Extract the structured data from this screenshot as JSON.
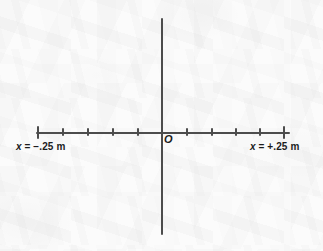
{
  "figure": {
    "name": "one-dimensional-position-axis",
    "background_color": "#fbfbfb",
    "ink_color": "#4c4c4c",
    "text_color": "#1c1c1c",
    "origin_label": "O",
    "left_label": {
      "variable": "x",
      "relation": "=",
      "value": "−.25 m",
      "full_text": "x = −.25 m"
    },
    "right_label": {
      "variable": "x",
      "relation": "=",
      "value": "+.25 m",
      "full_text": "x = +.25 m"
    }
  },
  "chart_data": {
    "type": "line",
    "title": "",
    "subtitle": "",
    "xlabel": "x",
    "ylabel": "",
    "grid": false,
    "legend": null,
    "annotations": [
      {
        "text": "O",
        "role": "origin-marker",
        "x": 0
      },
      {
        "text": "x = −.25 m",
        "role": "axis-end-label",
        "x": -0.25
      },
      {
        "text": "x = +.25 m",
        "role": "axis-end-label",
        "x": 0.25
      }
    ],
    "axes": [
      {
        "orientation": "horizontal",
        "unit": "m",
        "xlim": [
          -0.25,
          0.25
        ],
        "tick_interval": 0.05,
        "tick_values": [
          -0.25,
          -0.2,
          -0.15,
          -0.1,
          -0.05,
          0.0,
          0.05,
          0.1,
          0.15,
          0.2,
          0.25
        ],
        "tick_labels": [
          "x = −.25 m",
          "",
          "",
          "",
          "",
          "O",
          "",
          "",
          "",
          "",
          "x = +.25 m"
        ],
        "endpoint_ticks": [
          -0.25,
          0.25
        ],
        "pixel_positions": [
          37,
          62,
          87,
          112,
          137,
          161,
          186,
          211,
          235,
          259,
          283
        ]
      },
      {
        "orientation": "vertical",
        "unit": "",
        "ticks": [],
        "pixel_position": 161,
        "pixel_extent": [
          18,
          235
        ]
      }
    ],
    "series": [],
    "values": []
  },
  "geometry": {
    "width": 323,
    "height": 251,
    "vertical_axis": {
      "x": 161,
      "top": 18,
      "bottom": 235
    },
    "horizontal_axis": {
      "y": 132,
      "left": 36,
      "right": 290
    },
    "tick_top_minor": 128,
    "tick_top_major": 126,
    "label_y": 142,
    "left_label_x": 16,
    "right_label_x": 250,
    "origin_x": 164,
    "origin_y": 134
  }
}
